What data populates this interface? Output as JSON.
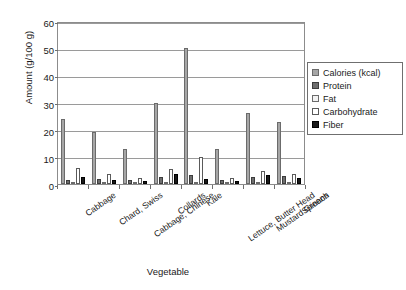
{
  "chart_data": {
    "type": "bar",
    "title": "",
    "xlabel": "Vegetable",
    "ylabel": "Amount (g/100 g)",
    "ylim": [
      0,
      60
    ],
    "yticks": [
      0,
      10,
      20,
      30,
      40,
      50,
      60
    ],
    "grid": true,
    "legend_position": "right",
    "categories": [
      "Cabbage",
      "Chard, Swiss",
      "Cabbage, Chinese",
      "Collards",
      "Kale",
      "Lettuce, Butter Head",
      "Mustard Greens",
      "Spinach"
    ],
    "series": [
      {
        "name": "Calories (kcal)",
        "color": "#a6a6a6",
        "values": [
          24,
          19,
          13,
          30,
          50,
          13,
          26,
          23
        ]
      },
      {
        "name": "Protein",
        "color": "#6e6e6e",
        "values": [
          1.3,
          1.8,
          1.5,
          2.5,
          3.3,
          1.3,
          2.7,
          2.9
        ]
      },
      {
        "name": "Fat",
        "color": "#f2f2f2",
        "values": [
          0.1,
          0.2,
          0.2,
          0.4,
          0.7,
          0.2,
          0.2,
          0.4
        ]
      },
      {
        "name": "Carbohydrate",
        "color": "#ffffff",
        "values": [
          5.8,
          3.7,
          2.2,
          5.7,
          10.0,
          2.2,
          4.9,
          3.6
        ]
      },
      {
        "name": "Fiber",
        "color": "#191919",
        "values": [
          2.5,
          1.6,
          1.0,
          3.6,
          2.0,
          1.1,
          3.2,
          2.2
        ]
      }
    ]
  },
  "legend": {
    "items": [
      {
        "label": "Calories (kcal)"
      },
      {
        "label": "Protein"
      },
      {
        "label": "Fat"
      },
      {
        "label": "Carbohydrate"
      },
      {
        "label": "Fiber"
      }
    ]
  },
  "axes": {
    "y_title": "Amount (g/100 g)",
    "x_title": "Vegetable"
  }
}
